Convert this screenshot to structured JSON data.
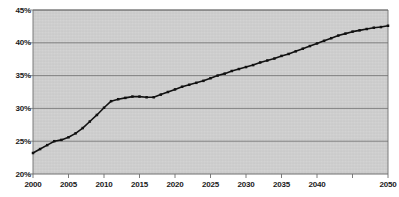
{
  "chart_data": {
    "type": "line",
    "title": "",
    "subtitle": "",
    "xlabel": "",
    "ylabel": "",
    "legend": [],
    "legend_position": "none",
    "grid": true,
    "grid_axis": "y",
    "xlim": [
      2000,
      2050
    ],
    "ylim": [
      20,
      45
    ],
    "ytick_labels": [
      "45%",
      "40%",
      "35%",
      "30%",
      "25%",
      "20%"
    ],
    "ytick_values": [
      45,
      40,
      35,
      30,
      25,
      20
    ],
    "xtick_labels": [
      "2000",
      "2005",
      "2010",
      "2015",
      "2020",
      "2025",
      "2030",
      "2035",
      "2040",
      "2045",
      "2050"
    ],
    "xtick_values": [
      2000,
      2005,
      2010,
      2015,
      2020,
      2025,
      2030,
      2035,
      2040,
      2045,
      2050
    ],
    "xtick_labels_shown": [
      "2000",
      "2005",
      "2010",
      "2015",
      "2020",
      "2025",
      "2030",
      "2035",
      "2040",
      "2050"
    ],
    "marker": "square",
    "line_color": "#111111",
    "marker_color": "#111111",
    "plot_background": "#cbcbcb",
    "grid_color": "#6e6e6e",
    "axis_color": "#6e6e6e",
    "x": [
      2000,
      2001,
      2002,
      2003,
      2004,
      2005,
      2006,
      2007,
      2008,
      2009,
      2010,
      2011,
      2012,
      2013,
      2014,
      2015,
      2016,
      2017,
      2018,
      2019,
      2020,
      2021,
      2022,
      2023,
      2024,
      2025,
      2026,
      2027,
      2028,
      2029,
      2030,
      2031,
      2032,
      2033,
      2034,
      2035,
      2036,
      2037,
      2038,
      2039,
      2040,
      2041,
      2042,
      2043,
      2044,
      2045,
      2046,
      2047,
      2048,
      2049,
      2050
    ],
    "values": [
      23.2,
      23.8,
      24.4,
      25.0,
      25.2,
      25.6,
      26.2,
      27.0,
      28.0,
      29.0,
      30.1,
      31.1,
      31.4,
      31.6,
      31.8,
      31.8,
      31.7,
      31.7,
      32.1,
      32.5,
      32.9,
      33.3,
      33.6,
      33.9,
      34.2,
      34.6,
      35.0,
      35.3,
      35.7,
      36.0,
      36.3,
      36.6,
      37.0,
      37.3,
      37.6,
      38.0,
      38.3,
      38.7,
      39.1,
      39.5,
      39.9,
      40.3,
      40.7,
      41.1,
      41.4,
      41.7,
      41.9,
      42.1,
      42.3,
      42.4,
      42.6
    ]
  }
}
